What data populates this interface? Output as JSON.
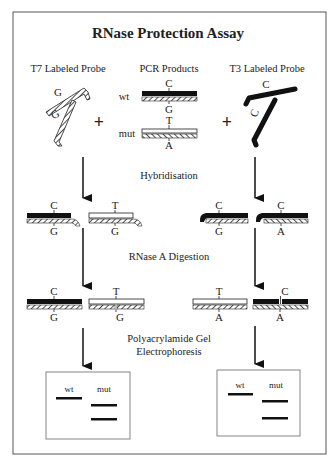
{
  "title": "RNase Protection Assay",
  "headers": {
    "t7_probe": "T7 Labeled Probe",
    "pcr_products": "PCR Products",
    "t3_probe": "T3 Labeled Probe"
  },
  "operators": {
    "plus": "+"
  },
  "pcr": {
    "wt_label": "wt",
    "mut_label": "mut",
    "wt_top_base": "C",
    "wt_bottom_base": "G",
    "mut_top_base": "T",
    "mut_bottom_base": "A"
  },
  "t7_probe_bases": [
    "G",
    "G"
  ],
  "t3_probe_bases": [
    "C",
    "C"
  ],
  "stages": {
    "hybridisation": "Hybridisation",
    "digestion": "RNase A Digestion",
    "gel_line1": "Polyacrylamide Gel",
    "gel_line2": "Electrophoresis"
  },
  "hybrid": {
    "left": [
      {
        "top": "C",
        "bottom": "G"
      },
      {
        "top": "T",
        "bottom": "G"
      }
    ],
    "right": [
      {
        "top": "C",
        "bottom": "G"
      },
      {
        "top": "C",
        "bottom": "A"
      }
    ]
  },
  "digest": {
    "left": [
      {
        "top": "C",
        "bottom": "G"
      },
      {
        "top": "T",
        "bottom": "G"
      }
    ],
    "right": [
      {
        "top": "T",
        "bottom": "A"
      },
      {
        "top": "C",
        "bottom": "A"
      }
    ]
  },
  "gels": {
    "left": {
      "lane1": "wt",
      "lane2": "mut"
    },
    "right": {
      "lane1": "wt",
      "lane2": "mut"
    }
  }
}
